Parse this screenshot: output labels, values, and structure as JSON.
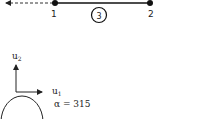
{
  "diagram": {
    "elements": [
      {
        "id": "1",
        "label": "1",
        "type": "node"
      },
      {
        "id": "2",
        "label": "2",
        "type": "node"
      },
      {
        "id": "3",
        "label": "3",
        "type": "element-circle-label"
      }
    ],
    "nodes": {
      "node1": {
        "label": "1"
      },
      "node2": {
        "label": "2"
      }
    },
    "element": {
      "label": "3"
    },
    "axes": {
      "u1": {
        "base": "u",
        "sub": "1"
      },
      "u2": {
        "base": "u",
        "sub": "2"
      }
    },
    "angle": {
      "symbol": "α",
      "equals": "=",
      "value": "315",
      "text": "α = 315"
    },
    "colors": {
      "line": "#111111",
      "dashed": "#333333",
      "text": "#222222"
    }
  }
}
